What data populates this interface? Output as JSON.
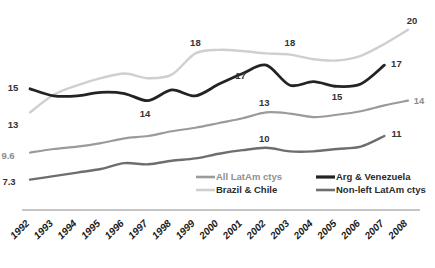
{
  "chart_data": {
    "type": "line",
    "title": "",
    "subtitle": "",
    "xlabel": "",
    "ylabel": "",
    "grid": false,
    "legend_position": "inside-bottom-center",
    "x": [
      1992,
      1993,
      1994,
      1995,
      1996,
      1997,
      1998,
      1999,
      2000,
      2001,
      2002,
      2003,
      2004,
      2005,
      2006,
      2007,
      2008
    ],
    "categories": [
      "1992",
      "1993",
      "1994",
      "1995",
      "1996",
      "1997",
      "1998",
      "1999",
      "2000",
      "2001",
      "2002",
      "2003",
      "2004",
      "2005",
      "2006",
      "2007",
      "2008"
    ],
    "ylim": [
      6,
      21
    ],
    "xlim": [
      1992,
      2008
    ],
    "series": [
      {
        "name": "All LatAm ctys",
        "color": "#9b9b9b",
        "width": 2.2,
        "values": [
          9.6,
          9.9,
          10.1,
          10.4,
          10.8,
          11.0,
          11.4,
          11.7,
          12.1,
          12.5,
          13.0,
          12.9,
          12.6,
          12.8,
          13.1,
          13.6,
          14.0
        ]
      },
      {
        "name": "Brazil & Chile",
        "color": "#cfcfcf",
        "width": 2.4,
        "values": [
          13.0,
          14.5,
          15.3,
          15.9,
          16.3,
          15.9,
          16.2,
          18.0,
          18.3,
          18.2,
          18.0,
          17.9,
          17.5,
          17.4,
          17.8,
          18.8,
          20.0
        ]
      },
      {
        "name": "Arg & Venezuela",
        "color": "#232323",
        "width": 2.8,
        "values": [
          15.0,
          14.4,
          14.4,
          14.7,
          14.6,
          14.0,
          14.9,
          14.4,
          15.4,
          16.3,
          17.0,
          15.3,
          15.6,
          15.2,
          15.4,
          17.0,
          null
        ]
      },
      {
        "name": "Non-left LatAm ctys",
        "color": "#6e6e6e",
        "width": 2.4,
        "values": [
          7.3,
          7.6,
          7.9,
          8.2,
          8.7,
          8.6,
          8.9,
          9.1,
          9.5,
          9.8,
          10.0,
          9.7,
          9.7,
          9.9,
          10.1,
          11.0,
          null
        ]
      }
    ],
    "annotations": [
      {
        "id": "ann-left-15",
        "text": "15",
        "series": "Arg & Venezuela",
        "x": 1992,
        "y": 15.0,
        "tone": "dark"
      },
      {
        "id": "ann-left-13",
        "text": "13",
        "series": "Brazil & Chile",
        "x": 1992,
        "y": 13.0,
        "tone": "dark"
      },
      {
        "id": "ann-left-96",
        "text": "9.6",
        "series": "All LatAm ctys",
        "x": 1992,
        "y": 9.6,
        "tone": "light"
      },
      {
        "id": "ann-left-73",
        "text": "7.3",
        "series": "Non-left LatAm ctys",
        "x": 1992,
        "y": 7.3,
        "tone": "dark"
      },
      {
        "id": "ann-mid-14",
        "text": "14",
        "series": "Arg & Venezuela",
        "x": 1997,
        "y": 14.0,
        "tone": "dark"
      },
      {
        "id": "ann-mid-18a",
        "text": "18",
        "series": "Brazil & Chile",
        "x": 1999,
        "y": 18.0,
        "tone": "dark"
      },
      {
        "id": "ann-mid-17",
        "text": "17",
        "series": "Arg & Venezuela",
        "x": 2001,
        "y": 17.0,
        "tone": "dark"
      },
      {
        "id": "ann-mid-18b",
        "text": "18",
        "series": "Brazil & Chile",
        "x": 2003,
        "y": 18.0,
        "tone": "dark"
      },
      {
        "id": "ann-mid-13",
        "text": "13",
        "series": "All LatAm ctys",
        "x": 2002,
        "y": 13.0,
        "tone": "dark"
      },
      {
        "id": "ann-mid-10",
        "text": "10",
        "series": "Non-left LatAm ctys",
        "x": 2002,
        "y": 10.0,
        "tone": "dark"
      },
      {
        "id": "ann-mid-15",
        "text": "15",
        "series": "Arg & Venezuela",
        "x": 2005,
        "y": 15.2,
        "tone": "dark"
      },
      {
        "id": "ann-right-20",
        "text": "20",
        "series": "Brazil & Chile",
        "x": 2008,
        "y": 20.0,
        "tone": "dark"
      },
      {
        "id": "ann-right-17",
        "text": "17",
        "series": "Arg & Venezuela",
        "x": 2007,
        "y": 17.0,
        "tone": "dark"
      },
      {
        "id": "ann-right-14",
        "text": "14",
        "series": "All LatAm ctys",
        "x": 2008,
        "y": 14.0,
        "tone": "light"
      },
      {
        "id": "ann-right-11",
        "text": "11",
        "series": "Non-left LatAm ctys",
        "x": 2007,
        "y": 11.0,
        "tone": "dark"
      }
    ]
  },
  "legend": {
    "entries": [
      {
        "label": "All LatAm ctys",
        "color": "#9b9b9b",
        "tone": "muted"
      },
      {
        "label": "Arg & Venezuela",
        "color": "#232323",
        "tone": "strong"
      },
      {
        "label": "Brazil & Chile",
        "color": "#cfcfcf",
        "tone": "strong"
      },
      {
        "label": "Non-left LatAm ctys",
        "color": "#6e6e6e",
        "tone": "strong"
      }
    ]
  },
  "axis": {
    "baseline_color": "#b3b3b3",
    "tick_labels": [
      "1992",
      "1993",
      "1994",
      "1995",
      "1996",
      "1997",
      "1998",
      "1999",
      "2000",
      "2001",
      "2002",
      "2003",
      "2004",
      "2005",
      "2006",
      "2007",
      "2008"
    ]
  }
}
